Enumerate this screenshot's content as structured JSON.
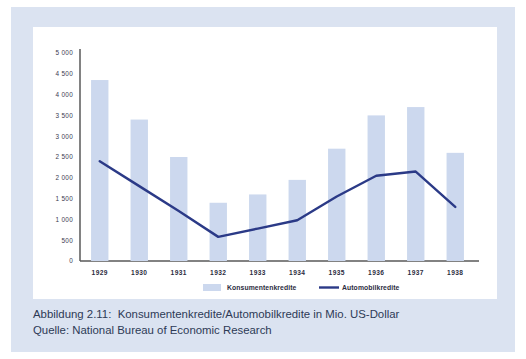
{
  "figure": {
    "caption_line1": "Abbildung 2.11:  Konsumentenkredite/Automobilkredite in Mio. US-Dollar",
    "caption_line2": "Quelle: National Bureau of Economic Research"
  },
  "colors": {
    "panel_background": "#dbe3f1",
    "card_background": "#ffffff",
    "bar_fill": "#ccd8ee",
    "line_stroke": "#2b3a87",
    "axis_stroke": "#595959",
    "tick_text": "#3b3b4f",
    "caption_text": "#2d3a56"
  },
  "chart_data": {
    "type": "bar",
    "title": "",
    "subtitle": "",
    "xlabel": "",
    "ylabel": "",
    "categories": [
      "1929",
      "1930",
      "1931",
      "1932",
      "1933",
      "1934",
      "1935",
      "1936",
      "1937",
      "1938"
    ],
    "ylim": [
      0,
      5000
    ],
    "ytick_labels": [
      "5 000",
      "4 500",
      "4 000",
      "3 500",
      "3 000",
      "2 500",
      "2 000",
      "1 500",
      "1 000",
      "500",
      "0"
    ],
    "ytick_values": [
      5000,
      4500,
      4000,
      3500,
      3000,
      2500,
      2000,
      1500,
      1000,
      500,
      0
    ],
    "grid": false,
    "legend_position": "bottom",
    "units": "Mio. US-Dollar",
    "series": [
      {
        "name": "Konsumentenkredite",
        "type": "bar",
        "color": "#ccd8ee",
        "values": [
          4350,
          3400,
          2500,
          1400,
          1600,
          1950,
          2700,
          3500,
          3700,
          2600
        ]
      },
      {
        "name": "Automobilkredite",
        "type": "line",
        "color": "#2b3a87",
        "values": [
          2400,
          1800,
          1200,
          580,
          780,
          980,
          1550,
          2050,
          2150,
          1300
        ]
      }
    ]
  },
  "legend": {
    "items": [
      {
        "label": "Konsumentenkredite",
        "marker": "swatch"
      },
      {
        "label": "Automobilkredite",
        "marker": "line"
      }
    ]
  }
}
